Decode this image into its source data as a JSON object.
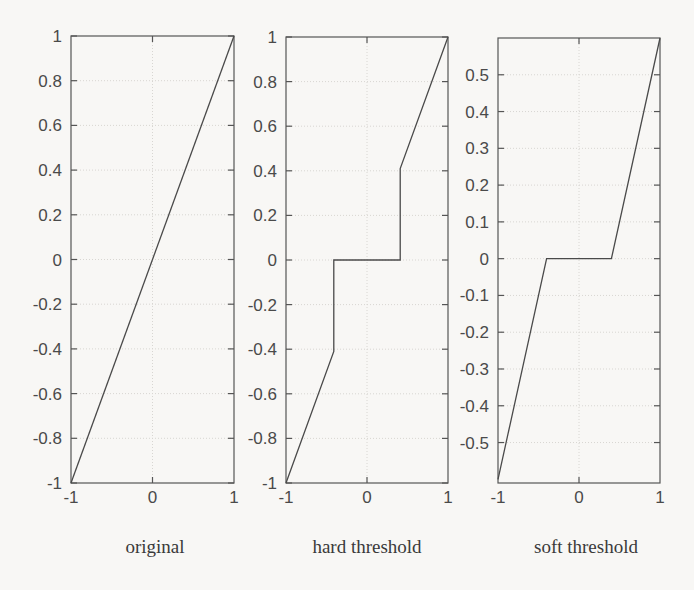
{
  "figure": {
    "background_color": "#f8f7f5",
    "axis_color": "#555555",
    "line_color": "#4a4a4a",
    "grid_color": "#d8d6d2"
  },
  "panels": [
    {
      "id": "original",
      "caption": "original",
      "xlabel": "",
      "ylabel": "",
      "xticks": [
        "-1",
        "0",
        "1"
      ],
      "xtick_values": [
        -1,
        0,
        1
      ],
      "yticks": [
        "-1",
        "-0.8",
        "-0.6",
        "-0.4",
        "-0.2",
        "0",
        "0.2",
        "0.4",
        "0.6",
        "0.8",
        "1"
      ],
      "ytick_values": [
        -1,
        -0.8,
        -0.6,
        -0.4,
        -0.2,
        0,
        0.2,
        0.4,
        0.6,
        0.8,
        1
      ],
      "xlim": [
        -1,
        1
      ],
      "ylim": [
        -1,
        1
      ]
    },
    {
      "id": "hard-threshold",
      "caption": "hard threshold",
      "xlabel": "",
      "ylabel": "",
      "xticks": [
        "-1",
        "0",
        "1"
      ],
      "xtick_values": [
        -1,
        0,
        1
      ],
      "yticks": [
        "-1",
        "-0.8",
        "-0.6",
        "-0.4",
        "-0.2",
        "0",
        "0.2",
        "0.4",
        "0.6",
        "0.8",
        "1"
      ],
      "ytick_values": [
        -1,
        -0.8,
        -0.6,
        -0.4,
        -0.2,
        0,
        0.2,
        0.4,
        0.6,
        0.8,
        1
      ],
      "xlim": [
        -1,
        1
      ],
      "ylim": [
        -1,
        1
      ]
    },
    {
      "id": "soft-threshold",
      "caption": "soft threshold",
      "xlabel": "",
      "ylabel": "",
      "xticks": [
        "-1",
        "0",
        "1"
      ],
      "xtick_values": [
        -1,
        0,
        1
      ],
      "yticks": [
        "-0.5",
        "-0.4",
        "-0.3",
        "-0.2",
        "-0.1",
        "0",
        "0.1",
        "0.2",
        "0.3",
        "0.4",
        "0.5"
      ],
      "ytick_values": [
        -0.5,
        -0.4,
        -0.3,
        -0.2,
        -0.1,
        0,
        0.1,
        0.2,
        0.3,
        0.4,
        0.5
      ],
      "xlim": [
        -1,
        1
      ],
      "ylim": [
        -0.61,
        0.6
      ]
    }
  ],
  "chart_data": [
    {
      "type": "line",
      "title": "original",
      "xlabel": "",
      "ylabel": "",
      "xlim": [
        -1,
        1
      ],
      "ylim": [
        -1,
        1
      ],
      "grid": true,
      "legend": "none",
      "x": [
        -1,
        1
      ],
      "values": [
        -1,
        1
      ],
      "description": "Identity mapping y = x"
    },
    {
      "type": "line",
      "title": "hard threshold",
      "xlabel": "",
      "ylabel": "",
      "xlim": [
        -1,
        1
      ],
      "ylim": [
        -1,
        1
      ],
      "grid": true,
      "legend": "none",
      "threshold": 0.41,
      "x": [
        -1,
        -0.41,
        -0.41,
        0.41,
        0.41,
        1
      ],
      "values": [
        -1,
        -0.41,
        0,
        0,
        0.41,
        1
      ],
      "description": "Hard thresholding: y = x for |x| > 0.41, else y = 0"
    },
    {
      "type": "line",
      "title": "soft threshold",
      "xlabel": "",
      "ylabel": "",
      "xlim": [
        -1,
        1
      ],
      "ylim": [
        -0.61,
        0.6
      ],
      "grid": true,
      "legend": "none",
      "threshold": 0.4,
      "x": [
        -1,
        -0.4,
        0.4,
        1
      ],
      "values": [
        -0.6,
        0,
        0,
        0.6
      ],
      "description": "Soft thresholding: y = sign(x)*max(|x|-0.4, 0)"
    }
  ]
}
